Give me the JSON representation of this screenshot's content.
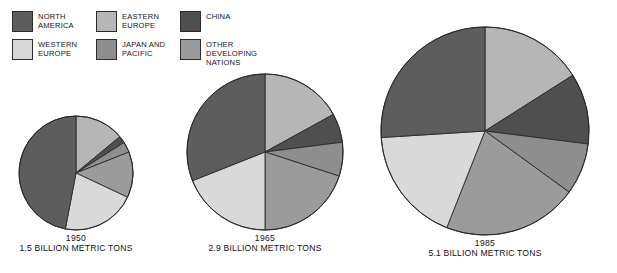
{
  "legend": {
    "columns": [
      [
        {
          "key": "north_america",
          "label": "NORTH\nAMERICA",
          "color": "#5d5d5d",
          "icon": "legend-swatch"
        },
        {
          "key": "western_europe",
          "label": "WESTERN\nEUROPE",
          "color": "#d9d9d9",
          "icon": "legend-swatch"
        }
      ],
      [
        {
          "key": "eastern_europe",
          "label": "EASTERN\nEUROPE",
          "color": "#b6b6b6",
          "icon": "legend-swatch"
        },
        {
          "key": "japan_pacific",
          "label": "JAPAN AND\nPACIFIC",
          "color": "#8e8e8e",
          "icon": "legend-swatch"
        }
      ],
      [
        {
          "key": "china",
          "label": "CHINA",
          "color": "#4f4f4f",
          "icon": "legend-swatch"
        },
        {
          "key": "other_developing",
          "label": "OTHER DEVELOPING\nNATIONS",
          "color": "#9b9b9b",
          "icon": "legend-swatch"
        }
      ]
    ]
  },
  "chart_data": {
    "type": "pie",
    "title": "",
    "subtitle": "",
    "xlabel": "",
    "ylabel": "",
    "legend_position": "top",
    "grid": false,
    "units": "BILLION METRIC TONS",
    "note": "Three proportional pie charts; radius scales with total emissions. Slices read clockwise from 12 o'clock.",
    "category_order": [
      "EASTERN EUROPE",
      "CHINA",
      "JAPAN AND PACIFIC",
      "OTHER DEVELOPING NATIONS",
      "WESTERN EUROPE",
      "NORTH AMERICA"
    ],
    "colors": {
      "NORTH AMERICA": "#5d5d5d",
      "WESTERN EUROPE": "#d9d9d9",
      "EASTERN EUROPE": "#b6b6b6",
      "JAPAN AND PACIFIC": "#8e8e8e",
      "CHINA": "#4f4f4f",
      "OTHER DEVELOPING NATIONS": "#9b9b9b"
    },
    "charts": [
      {
        "id": "pie-1950",
        "year": "1950",
        "total_value": 1.5,
        "total_label": "1.5 BILLION METRIC TONS",
        "radius_px": 57,
        "center": {
          "x": 76,
          "y": 173
        },
        "slices": [
          {
            "label": "EASTERN EUROPE",
            "value": 14,
            "color": "#b6b6b6"
          },
          {
            "label": "CHINA",
            "value": 2,
            "color": "#4f4f4f"
          },
          {
            "label": "JAPAN AND PACIFIC",
            "value": 3,
            "color": "#8e8e8e"
          },
          {
            "label": "OTHER DEVELOPING NATIONS",
            "value": 13,
            "color": "#9b9b9b"
          },
          {
            "label": "WESTERN EUROPE",
            "value": 21,
            "color": "#d9d9d9"
          },
          {
            "label": "NORTH AMERICA",
            "value": 47,
            "color": "#5d5d5d"
          }
        ]
      },
      {
        "id": "pie-1965",
        "year": "1965",
        "total_value": 2.9,
        "total_label": "2.9 BILLION METRIC TONS",
        "radius_px": 78,
        "center": {
          "x": 265,
          "y": 152
        },
        "slices": [
          {
            "label": "EASTERN EUROPE",
            "value": 17,
            "color": "#b6b6b6"
          },
          {
            "label": "CHINA",
            "value": 6,
            "color": "#4f4f4f"
          },
          {
            "label": "JAPAN AND PACIFIC",
            "value": 7,
            "color": "#8e8e8e"
          },
          {
            "label": "OTHER DEVELOPING NATIONS",
            "value": 20,
            "color": "#9b9b9b"
          },
          {
            "label": "WESTERN EUROPE",
            "value": 19,
            "color": "#d9d9d9"
          },
          {
            "label": "NORTH AMERICA",
            "value": 31,
            "color": "#5d5d5d"
          }
        ]
      },
      {
        "id": "pie-1985",
        "year": "1985",
        "total_value": 5.1,
        "total_label": "5.1 BILLION METRIC TONS",
        "radius_px": 104,
        "center": {
          "x": 485,
          "y": 131
        },
        "slices": [
          {
            "label": "EASTERN EUROPE",
            "value": 16,
            "color": "#b6b6b6"
          },
          {
            "label": "CHINA",
            "value": 11,
            "color": "#4f4f4f"
          },
          {
            "label": "JAPAN AND PACIFIC",
            "value": 8,
            "color": "#8e8e8e"
          },
          {
            "label": "OTHER DEVELOPING NATIONS",
            "value": 21,
            "color": "#9b9b9b"
          },
          {
            "label": "WESTERN EUROPE",
            "value": 18,
            "color": "#d9d9d9"
          },
          {
            "label": "NORTH AMERICA",
            "value": 26,
            "color": "#5d5d5d"
          }
        ]
      }
    ]
  }
}
